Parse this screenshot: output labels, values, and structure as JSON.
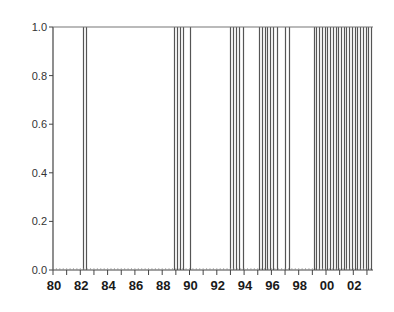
{
  "chart_data": {
    "type": "bar",
    "subtype": "indicator-spikes",
    "title": "",
    "xlabel": "",
    "ylabel": "",
    "xlim": [
      1979.9,
      2003.5
    ],
    "ylim": [
      0.0,
      1.0
    ],
    "grid": false,
    "legend": "none",
    "yticks": [
      0.0,
      0.2,
      0.4,
      0.6,
      0.8,
      1.0
    ],
    "ytick_labels": [
      "0.0",
      "0.2",
      "0.4",
      "0.6",
      "0.8",
      "1.0"
    ],
    "xticks": [
      1980,
      1982,
      1984,
      1986,
      1988,
      1990,
      1992,
      1994,
      1996,
      1998,
      2000,
      2002
    ],
    "xtick_labels": [
      "80",
      "82",
      "84",
      "86",
      "88",
      "90",
      "92",
      "94",
      "96",
      "98",
      "00",
      "02"
    ],
    "series": [
      {
        "name": "regime indicator",
        "value": 1.0,
        "x": [
          1982.2,
          1982.4,
          1988.9,
          1989.1,
          1989.3,
          1989.5,
          1990.0,
          1993.0,
          1993.2,
          1993.4,
          1993.6,
          1993.9,
          1995.1,
          1995.3,
          1995.5,
          1995.7,
          1995.9,
          1996.1,
          1996.4,
          1997.0,
          1997.3,
          1999.1,
          1999.3,
          1999.5,
          1999.7,
          1999.9,
          2000.1,
          2000.3,
          2000.5,
          2000.7,
          2000.9,
          2001.1,
          2001.3,
          2001.5,
          2001.7,
          2001.9,
          2002.1,
          2002.3,
          2002.5,
          2002.7,
          2002.9,
          2003.1,
          2003.3
        ]
      }
    ]
  },
  "colors": {
    "line": "#555555",
    "axis": "#444444",
    "frame_top": "#777777"
  }
}
